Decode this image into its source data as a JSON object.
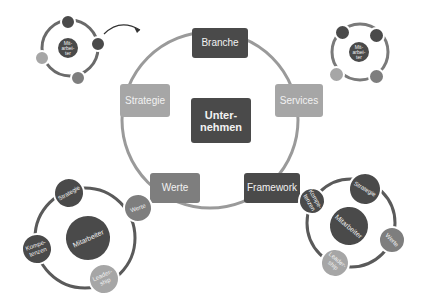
{
  "main_cycle": {
    "center": "Unter-\nnehmen",
    "nodes": [
      "Branche",
      "Services",
      "Framework",
      "Werte",
      "Strategie"
    ]
  },
  "left_bottom_cycle": {
    "center": "Mitarbeiter",
    "nodes": [
      "Strategie",
      "Werte",
      "Leader-\nship",
      "Kompe-\ntenzen"
    ]
  },
  "right_bottom_cycle": {
    "center": "Mitarbeiter",
    "nodes": [
      "Strategie",
      "Werte",
      "Leader-\nship",
      "Kompe-\ntenzen"
    ]
  },
  "top_left_cycle": {
    "center": "Mit-\narbei-\nter"
  },
  "top_right_cycle": {
    "center": "Mit-\narbei-\nter"
  },
  "colors": {
    "dark": "#4a4a4a",
    "mid": "#7e7e7e",
    "light": "#a6a6a6"
  }
}
